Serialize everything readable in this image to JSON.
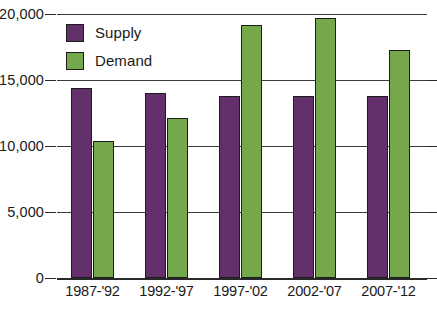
{
  "chart_data": {
    "type": "bar",
    "title": "",
    "subtitle": "",
    "xlabel": "",
    "ylabel": "",
    "categories": [
      "1987-'92",
      "1992-'97",
      "1997-'02",
      "2002-'07",
      "2007-'12"
    ],
    "series": [
      {
        "name": "Supply",
        "color": "#63306B",
        "values": [
          14400,
          14000,
          13800,
          13800,
          13800
        ]
      },
      {
        "name": "Demand",
        "color": "#74A84A",
        "values": [
          10400,
          12100,
          19200,
          19700,
          17300
        ]
      }
    ],
    "ylim": [
      0,
      20000
    ],
    "ytick_values": [
      0,
      5000,
      10000,
      20000,
      15000
    ],
    "ytick_labels": [
      "0",
      "5,000",
      "10,000",
      "15,000",
      "20,000"
    ],
    "grid": true,
    "legend_position": "top-left",
    "annotations": []
  },
  "axes": {
    "y_ticks": [
      {
        "label": "20,000",
        "value": 20000
      },
      {
        "label": "15,000",
        "value": 15000
      },
      {
        "label": "10,000",
        "value": 10000
      },
      {
        "label": "5,000",
        "value": 5000
      },
      {
        "label": "0",
        "value": 0
      }
    ],
    "x_ticks": [
      {
        "label": "1987-'92"
      },
      {
        "label": "1992-'97"
      },
      {
        "label": "1997-'02"
      },
      {
        "label": "2002-'07"
      },
      {
        "label": "2007-'12"
      }
    ]
  },
  "legend": {
    "items": [
      {
        "label": "Supply",
        "color": "#63306B"
      },
      {
        "label": "Demand",
        "color": "#74A84A"
      }
    ]
  },
  "colors": {
    "supply": "#63306B",
    "demand": "#74A84A",
    "axis": "#2a2a2a",
    "gridline": "#3b3b3b",
    "background": "#ffffff",
    "text": "#1a1a1a"
  }
}
